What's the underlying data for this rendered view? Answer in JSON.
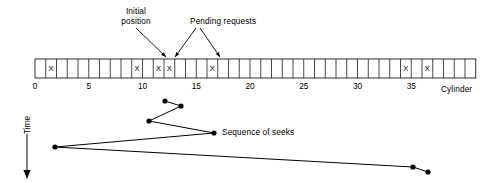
{
  "figure": {
    "title_visible": false,
    "annotations": [
      {
        "name": "initial-position",
        "line1": "Initial",
        "line2": "position",
        "x": 122,
        "y": 7
      },
      {
        "name": "pending-requests",
        "line1": "Pending requests",
        "line2": "",
        "x": 191,
        "y": 16
      },
      {
        "name": "sequence-of-seeks",
        "line1": "Sequence of seeks",
        "line2": "",
        "x": 222,
        "y": 127
      }
    ],
    "axis_label_time": "Time",
    "axis_label_cylinder": "Cylinder"
  },
  "cylinder_track": {
    "cell_count": 41,
    "x0": 35,
    "cell_width": 10.75,
    "top": 59,
    "height": 19,
    "marks_glyph": "X",
    "marked_cylinders": [
      1,
      9,
      11,
      12,
      16,
      34,
      36
    ],
    "initial_position_cylinder": 11,
    "pending_request_cylinders": [
      1,
      9,
      12,
      16,
      34,
      36
    ],
    "tick_values": [
      "0",
      "5",
      "10",
      "15",
      "20",
      "25",
      "30",
      "35"
    ],
    "tick_cylinders": [
      0,
      5,
      10,
      15,
      20,
      25,
      30,
      35
    ],
    "tick_y": 82
  },
  "chart_data": {
    "type": "line",
    "title": "Sequence of seeks",
    "xlabel": "Cylinder",
    "ylabel": "Time",
    "xlim": [
      0,
      41
    ],
    "grid": false,
    "legend": "none",
    "x": [
      11,
      12,
      9,
      16,
      1,
      34,
      36
    ],
    "y_order": [
      0,
      1,
      2,
      3,
      4,
      5,
      6
    ],
    "points_px": [
      {
        "cylinder": 11,
        "px": 165,
        "py": 101
      },
      {
        "cylinder": 12,
        "px": 181,
        "py": 106
      },
      {
        "cylinder": 9,
        "px": 149,
        "py": 121
      },
      {
        "cylinder": 16,
        "px": 214,
        "py": 133
      },
      {
        "cylinder": 1,
        "px": 55,
        "py": 147
      },
      {
        "cylinder": 34,
        "px": 413,
        "py": 167
      },
      {
        "cylinder": 36,
        "px": 428,
        "py": 172
      }
    ],
    "seek_order_label": "Sequence of seeks"
  },
  "annotation_arrows": [
    {
      "name": "initial-position-arrow",
      "x1": 136,
      "y1": 28,
      "x2": 166,
      "y2": 57
    },
    {
      "name": "pending-requests-arrow-left",
      "x1": 196,
      "y1": 28,
      "x2": 175,
      "y2": 57
    },
    {
      "name": "pending-requests-arrow-right",
      "x1": 200,
      "y1": 28,
      "x2": 220,
      "y2": 57
    }
  ]
}
